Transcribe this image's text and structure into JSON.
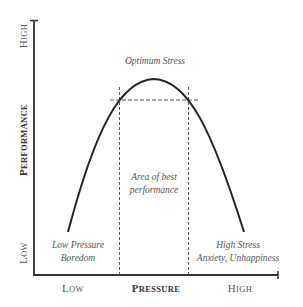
{
  "chart_data": {
    "type": "line",
    "title": "",
    "xlabel": "Pressure",
    "ylabel": "Performance",
    "x_ticks": [
      "Low",
      "High"
    ],
    "y_ticks": [
      "Low",
      "High"
    ],
    "curve": "inverted-U",
    "annotations": [
      {
        "text": "Optimum Stress",
        "position": "peak"
      },
      {
        "text": "Area of best performance",
        "position": "between dashed lines"
      },
      {
        "text": "Low Pressure",
        "position": "bottom-left"
      },
      {
        "text": "Boredom",
        "position": "bottom-left"
      },
      {
        "text": "High Stress",
        "position": "bottom-right"
      },
      {
        "text": "Anxiety, Unhappiness",
        "position": "bottom-right"
      }
    ],
    "grid": false,
    "legend": "none"
  },
  "axes": {
    "x_label": "Pressure",
    "x_low": "Low",
    "x_high": "High",
    "y_label": "Performance",
    "y_low": "Low",
    "y_high": "High"
  },
  "annotations": {
    "peak": "Optimum Stress",
    "area_line1": "Area of best",
    "area_line2": "performance",
    "left_line1": "Low Pressure",
    "left_line2": "Boredom",
    "right_line1": "High Stress",
    "right_line2": "Anxiety, Unhappiness"
  }
}
